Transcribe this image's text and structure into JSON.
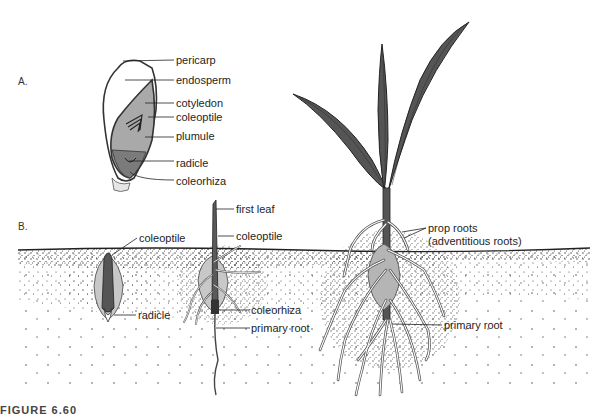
{
  "panels": {
    "a": {
      "label": "A."
    },
    "b": {
      "label": "B."
    }
  },
  "seed_labels": {
    "pericarp": "pericarp",
    "endosperm": "endosperm",
    "cotyledon": "cotyledon",
    "coleoptile": "coleoptile",
    "plumule": "plumule",
    "radicle": "radicle",
    "coleorhiza": "coleorhiza"
  },
  "stage1_labels": {
    "coleoptile": "coleoptile",
    "radicle": "radicle"
  },
  "stage2_labels": {
    "first_leaf": "first leaf",
    "coleoptile": "coleoptile",
    "coleorhiza": "coleorhiza",
    "primary_root": "primary root"
  },
  "stage3_labels": {
    "prop_roots": "prop roots",
    "adventitious_roots": "(adventitious roots)",
    "primary_root": "primary root"
  },
  "caption": "FIGURE 6.60",
  "colors": {
    "leaf": "#555555",
    "embryo": "#8a8a8a",
    "cotyledon_fill": "#a9a9a9",
    "seed_ghost": "#c8c8c8",
    "soil_dots": "#333333",
    "line": "#222222"
  }
}
